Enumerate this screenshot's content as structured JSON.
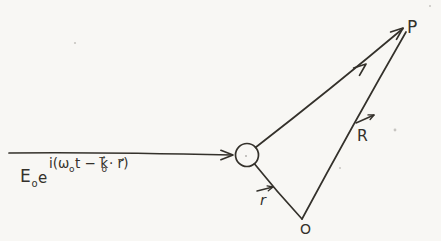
{
  "scene": {
    "background_color": "#f8f7f4",
    "ink_color": "#34312b"
  },
  "incident_wave": {
    "formula": {
      "amplitude_symbol": "E",
      "amplitude_subscript": "o",
      "exponential_base": "e",
      "exponent_open": "i(ω",
      "omega_subscript": "o",
      "exponent_middle": "t − k⃗",
      "k_subscript": "o",
      "exponent_close": "· r⃗)"
    }
  },
  "points": {
    "observation_point": "P",
    "origin_point": "O"
  },
  "vector_labels": {
    "R": "R",
    "r": "r"
  }
}
